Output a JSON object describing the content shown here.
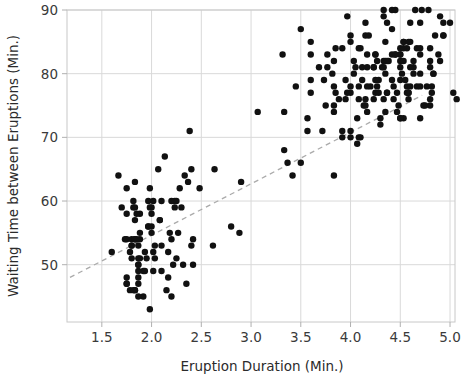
{
  "chart_data": {
    "type": "scatter",
    "title": "",
    "xlabel": "Eruption Duration (Min.)",
    "ylabel": "Waiting Time between Eruptions (Min.)",
    "xlim": [
      1.15,
      5.05
    ],
    "ylim": [
      41.0,
      90.0
    ],
    "xticks": [
      1.5,
      2.0,
      2.5,
      3.0,
      3.5,
      4.0,
      4.5,
      5.0
    ],
    "xtick_labels": [
      "1.5",
      "2.0",
      "2.5",
      "3.0",
      "3.5",
      "4.0",
      "4.5",
      "5.0"
    ],
    "yticks": [
      50,
      60,
      70,
      80,
      90
    ],
    "ytick_labels": [
      "50",
      "60",
      "70",
      "80",
      "90"
    ],
    "grid": true,
    "grid_color": "#d9d9d9",
    "legend": "none",
    "point_color": "#111111",
    "point_size": 3.2,
    "trendline": {
      "style": "dashed",
      "color": "#aaaaaa",
      "x0": 1.18,
      "y0": 48.0,
      "x1": 4.72,
      "y1": 76.6
    },
    "points": [
      [
        3.6,
        79
      ],
      [
        1.8,
        54
      ],
      [
        3.333,
        74
      ],
      [
        2.283,
        62
      ],
      [
        4.533,
        85
      ],
      [
        2.883,
        55
      ],
      [
        4.7,
        88
      ],
      [
        3.6,
        85
      ],
      [
        1.95,
        51
      ],
      [
        4.35,
        85
      ],
      [
        1.833,
        54
      ],
      [
        3.917,
        84
      ],
      [
        4.2,
        78
      ],
      [
        1.75,
        47
      ],
      [
        4.7,
        83
      ],
      [
        2.167,
        52
      ],
      [
        1.75,
        62
      ],
      [
        4.8,
        84
      ],
      [
        1.6,
        52
      ],
      [
        4.25,
        79
      ],
      [
        1.8,
        51
      ],
      [
        1.75,
        47
      ],
      [
        3.45,
        78
      ],
      [
        3.067,
        74
      ],
      [
        4.533,
        85
      ],
      [
        3.6,
        77
      ],
      [
        1.967,
        60
      ],
      [
        4.083,
        76
      ],
      [
        3.85,
        77
      ],
      [
        4.433,
        76
      ],
      [
        4.3,
        73
      ],
      [
        4.467,
        77
      ],
      [
        3.367,
        66
      ],
      [
        4.033,
        80
      ],
      [
        3.833,
        74
      ],
      [
        2.017,
        52
      ],
      [
        1.867,
        48
      ],
      [
        4.833,
        80
      ],
      [
        1.833,
        59
      ],
      [
        4.783,
        90
      ],
      [
        4.35,
        80
      ],
      [
        1.883,
        58
      ],
      [
        4.567,
        84
      ],
      [
        1.75,
        58
      ],
      [
        4.533,
        73
      ],
      [
        3.317,
        83
      ],
      [
        3.833,
        64
      ],
      [
        2.1,
        53
      ],
      [
        4.633,
        82
      ],
      [
        2.0,
        59
      ],
      [
        4.8,
        75
      ],
      [
        4.716,
        90
      ],
      [
        1.833,
        54
      ],
      [
        4.833,
        80
      ],
      [
        1.733,
        54
      ],
      [
        4.883,
        83
      ],
      [
        3.717,
        71
      ],
      [
        1.667,
        64
      ],
      [
        4.567,
        77
      ],
      [
        4.317,
        81
      ],
      [
        2.233,
        59
      ],
      [
        4.5,
        84
      ],
      [
        1.75,
        48
      ],
      [
        4.8,
        82
      ],
      [
        1.817,
        60
      ],
      [
        4.4,
        92
      ],
      [
        4.167,
        78
      ],
      [
        4.7,
        78
      ],
      [
        2.067,
        65
      ],
      [
        4.7,
        73
      ],
      [
        4.033,
        82
      ],
      [
        1.967,
        56
      ],
      [
        4.5,
        79
      ],
      [
        4.0,
        71
      ],
      [
        1.983,
        62
      ],
      [
        5.067,
        76
      ],
      [
        2.017,
        60
      ],
      [
        4.567,
        78
      ],
      [
        3.883,
        76
      ],
      [
        3.6,
        83
      ],
      [
        4.133,
        75
      ],
      [
        4.333,
        82
      ],
      [
        4.1,
        70
      ],
      [
        2.633,
        65
      ],
      [
        4.067,
        73
      ],
      [
        4.933,
        88
      ],
      [
        3.95,
        76
      ],
      [
        4.517,
        80
      ],
      [
        2.167,
        48
      ],
      [
        4.0,
        86
      ],
      [
        2.2,
        60
      ],
      [
        4.333,
        90
      ],
      [
        1.867,
        50
      ],
      [
        4.817,
        78
      ],
      [
        1.833,
        63
      ],
      [
        4.3,
        72
      ],
      [
        4.667,
        84
      ],
      [
        3.75,
        75
      ],
      [
        1.867,
        51
      ],
      [
        4.9,
        82
      ],
      [
        2.483,
        62
      ],
      [
        4.367,
        88
      ],
      [
        2.1,
        49
      ],
      [
        4.5,
        83
      ],
      [
        4.05,
        81
      ],
      [
        1.867,
        47
      ],
      [
        4.7,
        84
      ],
      [
        1.783,
        52
      ],
      [
        4.85,
        86
      ],
      [
        3.683,
        81
      ],
      [
        4.733,
        75
      ],
      [
        2.3,
        59
      ],
      [
        4.9,
        89
      ],
      [
        4.417,
        79
      ],
      [
        1.7,
        59
      ],
      [
        4.633,
        81
      ],
      [
        2.317,
        50
      ],
      [
        4.6,
        85
      ],
      [
        1.817,
        59
      ],
      [
        4.417,
        87
      ],
      [
        2.617,
        53
      ],
      [
        4.067,
        69
      ],
      [
        4.25,
        77
      ],
      [
        1.967,
        56
      ],
      [
        4.6,
        88
      ],
      [
        3.767,
        81
      ],
      [
        1.917,
        45
      ],
      [
        4.5,
        82
      ],
      [
        2.267,
        55
      ],
      [
        4.65,
        90
      ],
      [
        1.867,
        45
      ],
      [
        4.167,
        83
      ],
      [
        2.8,
        56
      ],
      [
        4.333,
        89
      ],
      [
        1.833,
        46
      ],
      [
        4.383,
        82
      ],
      [
        1.883,
        51
      ],
      [
        4.933,
        86
      ],
      [
        2.033,
        53
      ],
      [
        3.733,
        79
      ],
      [
        4.233,
        81
      ],
      [
        2.233,
        60
      ],
      [
        4.533,
        82
      ],
      [
        4.817,
        77
      ],
      [
        4.333,
        76
      ],
      [
        1.983,
        59
      ],
      [
        4.633,
        80
      ],
      [
        2.017,
        49
      ],
      [
        5.1,
        96
      ],
      [
        1.8,
        53
      ],
      [
        5.033,
        77
      ],
      [
        4.0,
        77
      ],
      [
        2.4,
        65
      ],
      [
        4.6,
        81
      ],
      [
        3.567,
        71
      ],
      [
        4.0,
        70
      ],
      [
        4.5,
        81
      ],
      [
        4.083,
        93
      ],
      [
        1.8,
        53
      ],
      [
        3.967,
        89
      ],
      [
        2.2,
        45
      ],
      [
        4.15,
        86
      ],
      [
        2.0,
        58
      ],
      [
        3.833,
        78
      ],
      [
        3.5,
        66
      ],
      [
        4.583,
        76
      ],
      [
        2.367,
        63
      ],
      [
        5.0,
        88
      ],
      [
        1.933,
        52
      ],
      [
        4.617,
        93
      ],
      [
        1.917,
        49
      ],
      [
        2.083,
        57
      ],
      [
        4.583,
        77
      ],
      [
        3.333,
        68
      ],
      [
        4.167,
        81
      ],
      [
        4.333,
        81
      ],
      [
        4.5,
        73
      ],
      [
        2.417,
        50
      ],
      [
        4.0,
        85
      ],
      [
        4.167,
        74
      ],
      [
        1.883,
        55
      ],
      [
        4.583,
        77
      ],
      [
        4.25,
        83
      ],
      [
        3.767,
        83
      ],
      [
        2.033,
        51
      ],
      [
        4.433,
        78
      ],
      [
        4.083,
        84
      ],
      [
        1.833,
        46
      ],
      [
        4.417,
        83
      ],
      [
        2.183,
        55
      ],
      [
        4.8,
        81
      ],
      [
        1.833,
        57
      ],
      [
        4.8,
        76
      ],
      [
        4.1,
        84
      ],
      [
        3.966,
        77
      ],
      [
        4.233,
        81
      ],
      [
        3.5,
        87
      ],
      [
        4.366,
        77
      ],
      [
        2.25,
        51
      ],
      [
        4.667,
        78
      ],
      [
        2.1,
        60
      ],
      [
        4.35,
        82
      ],
      [
        4.133,
        91
      ],
      [
        1.867,
        53
      ],
      [
        4.6,
        78
      ],
      [
        1.783,
        46
      ],
      [
        4.367,
        77
      ],
      [
        3.85,
        84
      ],
      [
        1.933,
        49
      ],
      [
        4.5,
        83
      ],
      [
        2.383,
        71
      ],
      [
        4.7,
        80
      ],
      [
        1.867,
        49
      ],
      [
        3.833,
        75
      ],
      [
        3.417,
        64
      ],
      [
        4.233,
        76
      ],
      [
        2.4,
        53
      ],
      [
        4.8,
        94
      ],
      [
        2.0,
        55
      ],
      [
        4.15,
        76
      ],
      [
        1.867,
        50
      ],
      [
        4.267,
        82
      ],
      [
        1.75,
        54
      ],
      [
        4.483,
        75
      ],
      [
        4.0,
        78
      ],
      [
        4.117,
        79
      ],
      [
        4.083,
        78
      ],
      [
        4.267,
        78
      ],
      [
        3.917,
        70
      ],
      [
        4.55,
        79
      ],
      [
        4.083,
        70
      ],
      [
        2.417,
        54
      ],
      [
        4.183,
        86
      ],
      [
        2.217,
        50
      ],
      [
        4.45,
        90
      ],
      [
        1.883,
        54
      ],
      [
        1.85,
        54
      ],
      [
        4.283,
        77
      ],
      [
        3.95,
        79
      ],
      [
        2.333,
        64
      ],
      [
        4.15,
        75
      ],
      [
        2.35,
        47
      ],
      [
        4.933,
        86
      ],
      [
        2.9,
        63
      ],
      [
        4.583,
        85
      ],
      [
        3.833,
        82
      ],
      [
        2.083,
        57
      ],
      [
        4.367,
        82
      ],
      [
        2.133,
        67
      ],
      [
        4.35,
        74
      ],
      [
        2.2,
        54
      ],
      [
        4.45,
        83
      ],
      [
        3.567,
        73
      ],
      [
        4.5,
        73
      ],
      [
        4.15,
        88
      ],
      [
        3.817,
        80
      ],
      [
        3.917,
        71
      ],
      [
        4.45,
        83
      ],
      [
        2.0,
        56
      ],
      [
        4.283,
        79
      ],
      [
        4.767,
        78
      ],
      [
        4.533,
        84
      ],
      [
        1.85,
        58
      ],
      [
        4.25,
        83
      ],
      [
        1.983,
        43
      ],
      [
        2.25,
        60
      ],
      [
        4.75,
        75
      ],
      [
        4.117,
        81
      ],
      [
        2.15,
        46
      ],
      [
        4.417,
        90
      ],
      [
        1.817,
        46
      ],
      [
        4.467,
        74
      ]
    ]
  }
}
